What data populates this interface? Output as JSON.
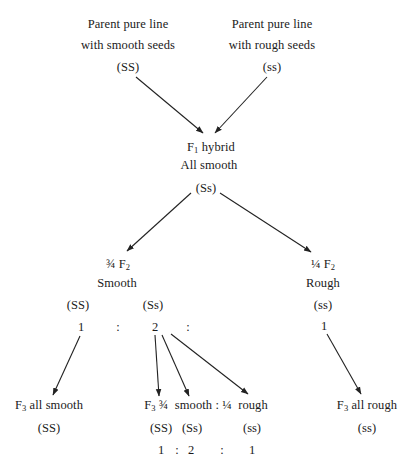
{
  "parents": {
    "smooth": {
      "line1": "Parent pure line",
      "line2": "with smooth seeds",
      "genotype": "(SS)"
    },
    "rough": {
      "line1": "Parent pure line",
      "line2": "with rough seeds",
      "genotype": "(ss)"
    }
  },
  "f1": {
    "prefix": "F",
    "sub": "1",
    "suffix": " hybrid",
    "phenotype": "All smooth",
    "genotype": "(Ss)"
  },
  "f2": {
    "smooth": {
      "fraction": "¾",
      "prefix": "F",
      "sub": "2",
      "phenotype": "Smooth",
      "genotype_ss_upper": "(SS)",
      "genotype_ss_mixed": "(Ss)"
    },
    "rough": {
      "fraction": "¼",
      "prefix": "F",
      "sub": "2",
      "phenotype": "Rough",
      "genotype": "(ss)"
    },
    "ratio": [
      "1",
      ":",
      "2",
      ":",
      "1"
    ]
  },
  "f3": {
    "all_smooth": {
      "prefix": "F",
      "sub": "3",
      "text": " all smooth",
      "genotype": "(SS)"
    },
    "segregating": {
      "prefix": "F",
      "sub": "3",
      "text": " ¾  smooth : ¼  rough",
      "genotypes": [
        "(SS)",
        "(Ss)",
        "(ss)"
      ],
      "ratio": [
        "1",
        ":",
        "2",
        ":",
        "1"
      ]
    },
    "all_rough": {
      "prefix": "F",
      "sub": "3",
      "text": " all rough",
      "genotype": "(ss)"
    }
  },
  "colors": {
    "text": "#1a1a1a",
    "arrow": "#222222",
    "background": "#ffffff"
  }
}
